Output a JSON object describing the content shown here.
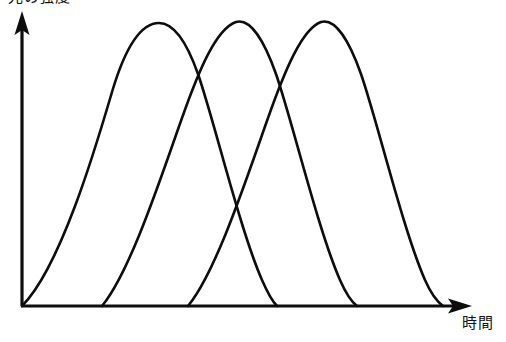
{
  "figure": {
    "width": 506,
    "height": 342,
    "background": "#ffffff",
    "ink_color": "#0d0d0d"
  },
  "axes": {
    "y_axis": {
      "label": "光の強度",
      "label_clipped_at_top": true,
      "arrow": "up",
      "x_px": 22,
      "top_px": 13,
      "bottom_px": 306
    },
    "x_axis": {
      "label": "時間",
      "arrow": "right",
      "y_px": 306,
      "left_px": 22,
      "right_px": 470
    }
  },
  "chart_data": {
    "type": "line",
    "title": "",
    "xlabel": "時間",
    "ylabel": "光の強度",
    "grid": false,
    "legend": null,
    "x_tick_labels": [],
    "y_tick_labels": [],
    "xlim": [
      0,
      100
    ],
    "ylim": [
      0,
      100
    ],
    "annotations": [],
    "series": [
      {
        "name": "curve-1",
        "start": 0,
        "peak_x": 30,
        "peak_y": 100,
        "end": 57,
        "points": [
          {
            "x": 0,
            "y": 0
          },
          {
            "x": 7,
            "y": 28
          },
          {
            "x": 14,
            "y": 55
          },
          {
            "x": 21,
            "y": 79
          },
          {
            "x": 26,
            "y": 93
          },
          {
            "x": 30,
            "y": 100
          },
          {
            "x": 35,
            "y": 97
          },
          {
            "x": 41,
            "y": 84
          },
          {
            "x": 47,
            "y": 62
          },
          {
            "x": 52,
            "y": 37
          },
          {
            "x": 57,
            "y": 0
          }
        ]
      },
      {
        "name": "curve-2",
        "start": 18,
        "peak_x": 47,
        "peak_y": 100,
        "end": 75,
        "points": [
          {
            "x": 18,
            "y": 0
          },
          {
            "x": 25,
            "y": 29
          },
          {
            "x": 32,
            "y": 57
          },
          {
            "x": 39,
            "y": 81
          },
          {
            "x": 43,
            "y": 93
          },
          {
            "x": 47,
            "y": 100
          },
          {
            "x": 52,
            "y": 97
          },
          {
            "x": 58,
            "y": 85
          },
          {
            "x": 64,
            "y": 63
          },
          {
            "x": 70,
            "y": 37
          },
          {
            "x": 75,
            "y": 0
          }
        ]
      },
      {
        "name": "curve-3",
        "start": 37,
        "peak_x": 67,
        "peak_y": 100,
        "end": 94,
        "points": [
          {
            "x": 37,
            "y": 0
          },
          {
            "x": 44,
            "y": 29
          },
          {
            "x": 51,
            "y": 57
          },
          {
            "x": 58,
            "y": 81
          },
          {
            "x": 63,
            "y": 93
          },
          {
            "x": 67,
            "y": 100
          },
          {
            "x": 72,
            "y": 97
          },
          {
            "x": 78,
            "y": 85
          },
          {
            "x": 84,
            "y": 63
          },
          {
            "x": 89,
            "y": 37
          },
          {
            "x": 94,
            "y": 0
          }
        ]
      }
    ],
    "paths_px": {
      "curve_1": "M 22 306 C 60 268 95 150 112 92 C 128 38 145 23 159 23 C 173 23 186 40 198 74 C 214 120 240 230 262 280 C 269 296 274 303 277 306",
      "curve_2": "M 102 306 C 130 272 160 180 182 118 C 199 70 216 29 236 22 C 250 18 264 40 276 74 C 292 120 318 230 340 280 C 347 296 353 303 357 306",
      "curve_3": "M 188 306 C 216 272 246 180 268 118 C 285 70 302 29 321 22 C 335 18 349 40 361 74 C 377 120 403 230 425 280 C 432 296 439 303 443 306"
    },
    "intersections_px": [
      {
        "between": [
          "curve-1",
          "curve-2"
        ],
        "x": 196,
        "y": 62
      },
      {
        "between": [
          "curve-1",
          "curve-3"
        ],
        "x": 237,
        "y": 172
      },
      {
        "between": [
          "curve-2",
          "curve-3"
        ],
        "x": 281,
        "y": 62
      }
    ]
  }
}
